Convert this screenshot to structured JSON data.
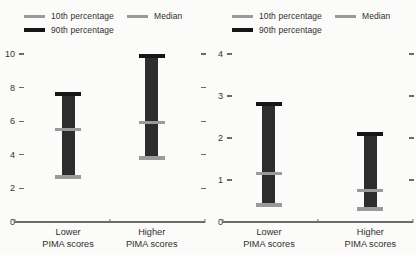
{
  "figure": {
    "background": "#fbfbf9",
    "text_color": "#2f2f2f",
    "colors": {
      "percentile_10_swatch": "#9a9a9a",
      "median_swatch": "#9a9a9a",
      "percentile_90_swatch": "#161616",
      "bar_body": "#2d2d2d",
      "axis": "#6b6b6b"
    },
    "legend": {
      "position": "top-left",
      "items": [
        {
          "label": "10th percentage",
          "swatch": "#9a9a9a"
        },
        {
          "label": "Median",
          "swatch": "#9a9a9a"
        },
        {
          "label": "90th percentage",
          "swatch": "#161616"
        }
      ]
    }
  },
  "chart_data": [
    {
      "type": "bar",
      "subtype": "percentile-range-bars",
      "title": "",
      "xlabel": "",
      "ylabel": "",
      "categories": [
        "Lower PIMA scores",
        "Higher PIMA scores"
      ],
      "series": [
        {
          "name": "10th percentage",
          "values": [
            2.7,
            3.8
          ]
        },
        {
          "name": "Median",
          "values": [
            5.5,
            5.9
          ]
        },
        {
          "name": "90th percentage",
          "values": [
            7.6,
            9.9
          ]
        }
      ],
      "ylim": [
        0,
        10
      ],
      "yticks": [
        0,
        2,
        4,
        6,
        8,
        10
      ],
      "grid": false,
      "legend_position": "top-left",
      "category_centers_pct": [
        27,
        74
      ]
    },
    {
      "type": "bar",
      "subtype": "percentile-range-bars",
      "title": "",
      "xlabel": "",
      "ylabel": "",
      "categories": [
        "Lower PIMA scores",
        "Higher PIMA scores"
      ],
      "series": [
        {
          "name": "10th percentage",
          "values": [
            0.4,
            0.3
          ]
        },
        {
          "name": "Median",
          "values": [
            1.15,
            0.75
          ]
        },
        {
          "name": "90th percentage",
          "values": [
            2.8,
            2.1
          ]
        }
      ],
      "ylim": [
        0,
        4
      ],
      "yticks": [
        0,
        1,
        2,
        3,
        4
      ],
      "grid": false,
      "legend_position": "top-left",
      "category_centers_pct": [
        23,
        80
      ]
    }
  ]
}
